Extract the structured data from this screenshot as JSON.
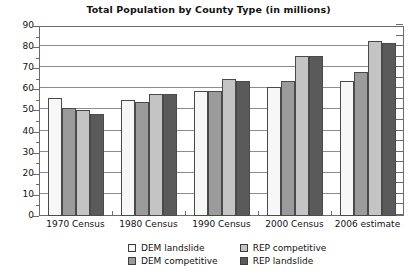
{
  "chart_data": {
    "type": "bar",
    "title": "Total Population by County Type (in millions)",
    "xlabel": "",
    "ylabel": "",
    "ylim": [
      0,
      90
    ],
    "ytick_step": 10,
    "yticks": [
      "0",
      "10",
      "20",
      "30",
      "40",
      "50",
      "60",
      "70",
      "80",
      "90"
    ],
    "grid": true,
    "legend_position": "bottom",
    "categories": [
      "1970 Census",
      "1980 Census",
      "1990 Census",
      "2000 Census",
      "2006 estimate"
    ],
    "series": [
      {
        "name": "DEM landslide",
        "color": "#f7f7f7",
        "values": [
          56,
          55,
          59,
          61,
          64
        ]
      },
      {
        "name": "DEM competitive",
        "color": "#9b9b9b",
        "values": [
          51,
          54,
          59,
          64,
          68
        ]
      },
      {
        "name": "REP competitive",
        "color": "#c4c4c4",
        "values": [
          50,
          58,
          65,
          76,
          83
        ]
      },
      {
        "name": "REP landslide",
        "color": "#5a5a5a",
        "values": [
          48.5,
          58,
          64,
          76,
          82
        ]
      }
    ]
  },
  "legend": {
    "items": [
      {
        "label": "DEM landslide"
      },
      {
        "label": "REP competitive"
      },
      {
        "label": "DEM competitive"
      },
      {
        "label": "REP landslide"
      }
    ]
  }
}
